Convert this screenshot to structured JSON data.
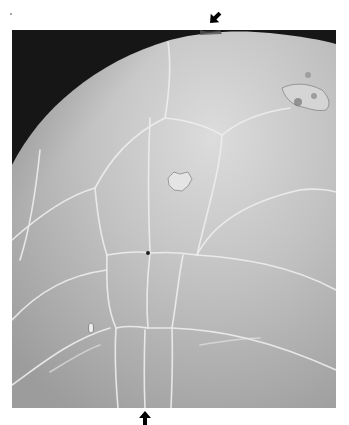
{
  "figure": {
    "type": "micrograph",
    "colors": {
      "page_background": "#ffffff",
      "photo_background": "#1a1a1a",
      "surface_light": "#d4d4d4",
      "surface_mid": "#b8b8b8",
      "surface_dark": "#9a9a9a",
      "plate_line": "#ececec",
      "arrow": "#000000"
    },
    "frame": {
      "x": 12,
      "y": 30,
      "width": 324,
      "height": 378
    },
    "arrows": [
      {
        "name": "top-arrow",
        "x": 215,
        "y": 18,
        "direction": "down-left"
      },
      {
        "name": "bottom-arrow",
        "x": 145,
        "y": 417,
        "direction": "up"
      }
    ]
  }
}
